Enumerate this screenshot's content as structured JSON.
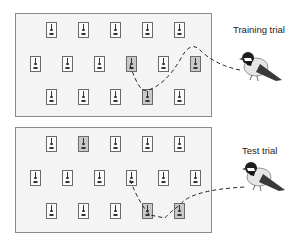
{
  "panels": [
    {
      "label": "Training trial",
      "visited": [
        [
          1,
          3
        ],
        [
          1,
          5
        ],
        [
          2,
          3
        ]
      ]
    },
    {
      "label": "Test trial",
      "visited": [
        [
          0,
          1
        ],
        [
          2,
          3
        ],
        [
          2,
          4
        ]
      ]
    }
  ],
  "grid": {
    "rows": [
      {
        "count": 5,
        "offset": 1
      },
      {
        "count": 6,
        "offset": 0
      },
      {
        "count": 5,
        "offset": 1
      }
    ]
  },
  "icons": {
    "feeder": "feeder-icon",
    "bird": "chickadee-bird-icon"
  }
}
